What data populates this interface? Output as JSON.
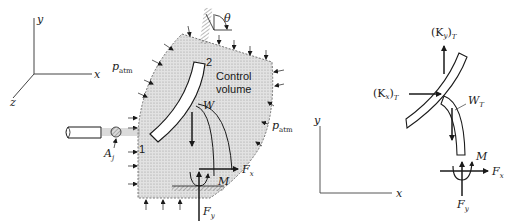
{
  "left_figure": {
    "axes": {
      "x": "x",
      "y": "y",
      "z": "z"
    },
    "angle_label": "θ",
    "section_2_label": "2",
    "section_1_label": "1",
    "pressure_left": {
      "base": "p",
      "sub": "atm"
    },
    "pressure_right": {
      "base": "p",
      "sub": "atm"
    },
    "control_volume_line1": "Control",
    "control_volume_line2": "volume",
    "weight_label": "W",
    "jet_area": {
      "base": "A",
      "sub": "j"
    },
    "force_x": {
      "base": "F",
      "sub": "x"
    },
    "force_y": {
      "base": "F",
      "sub": "y"
    },
    "moment_label": "M"
  },
  "right_figure": {
    "axes": {
      "x": "x",
      "y": "y"
    },
    "ky_label": {
      "open": "(K",
      "sub": "y",
      "close": ")",
      "sub2": "T"
    },
    "kx_label": {
      "open": "(K",
      "sub": "x",
      "close": ")",
      "sub2": "T"
    },
    "weight_label": {
      "base": "W",
      "sub": "T"
    },
    "force_x": {
      "base": "F",
      "sub": "x"
    },
    "force_y": {
      "base": "F",
      "sub": "y"
    },
    "moment_label": "M"
  },
  "colors": {
    "ink": "#1a1a1a",
    "control_volume_fill": "#d6d6d6",
    "jet_hatch": "#8a8a8a"
  }
}
